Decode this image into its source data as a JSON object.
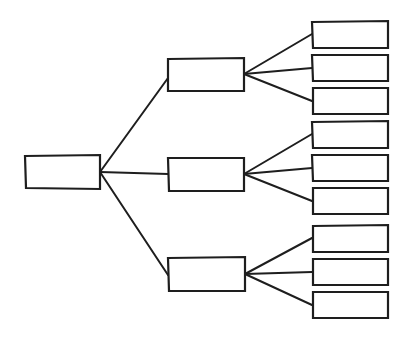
{
  "diagram": {
    "type": "tree",
    "style": "hand-drawn",
    "stroke_color": "#1e1e1e",
    "background": "#ffffff",
    "root": {
      "id": "root",
      "label": "",
      "box": [
        25,
        155,
        75,
        34
      ]
    },
    "children": [
      {
        "id": "mid-1",
        "label": "",
        "box": [
          168,
          58,
          76,
          33
        ],
        "children": [
          {
            "id": "leaf-1",
            "label": "",
            "box": [
              312,
              21,
              76,
              27
            ]
          },
          {
            "id": "leaf-2",
            "label": "",
            "box": [
              312,
              55,
              76,
              26
            ]
          },
          {
            "id": "leaf-3",
            "label": "",
            "box": [
              312,
              88,
              76,
              26
            ]
          }
        ]
      },
      {
        "id": "mid-2",
        "label": "",
        "box": [
          168,
          158,
          76,
          33
        ],
        "children": [
          {
            "id": "leaf-4",
            "label": "",
            "box": [
              312,
              121,
              76,
              27
            ]
          },
          {
            "id": "leaf-5",
            "label": "",
            "box": [
              312,
              155,
              76,
              26
            ]
          },
          {
            "id": "leaf-6",
            "label": "",
            "box": [
              312,
              188,
              76,
              26
            ]
          }
        ]
      },
      {
        "id": "mid-3",
        "label": "",
        "box": [
          168,
          257,
          77,
          34
        ],
        "children": [
          {
            "id": "leaf-7",
            "label": "",
            "box": [
              312,
              225,
              76,
              27
            ]
          },
          {
            "id": "leaf-8",
            "label": "",
            "box": [
              312,
              259,
              76,
              26
            ]
          },
          {
            "id": "leaf-9",
            "label": "",
            "box": [
              312,
              292,
              76,
              26
            ]
          }
        ]
      }
    ]
  }
}
